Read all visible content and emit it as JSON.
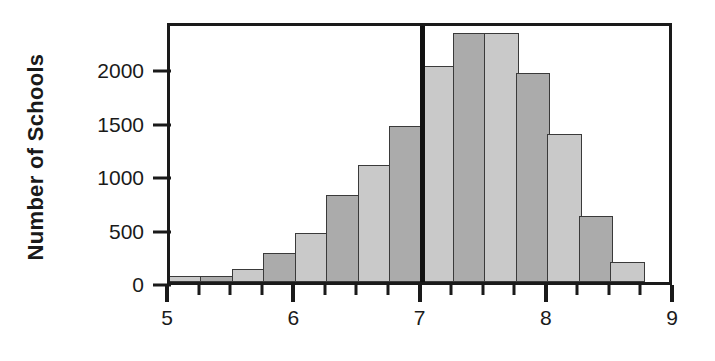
{
  "chart_data": {
    "type": "bar",
    "title": "",
    "subtitle": "",
    "xlabel": "",
    "ylabel": "Number of Schools",
    "xlim": [
      5,
      9
    ],
    "ylim": [
      0,
      2450
    ],
    "grid": false,
    "legend": null,
    "bin_width": 0.25,
    "x_tick_labels": [
      "5",
      "6",
      "7",
      "8",
      "9"
    ],
    "x_tick_values": [
      5,
      6,
      7,
      8,
      9
    ],
    "x_minor_tick_values": [
      5.25,
      5.5,
      5.75,
      6.25,
      6.5,
      6.75,
      7.25,
      7.5,
      7.75,
      8.25,
      8.5,
      8.75
    ],
    "y_tick_labels": [
      "0",
      "500",
      "1000",
      "1500",
      "2000"
    ],
    "y_tick_values": [
      0,
      500,
      1000,
      1500,
      2000
    ],
    "categories": [
      "5.00-5.25",
      "5.25-5.50",
      "5.50-5.75",
      "5.75-6.00",
      "6.00-6.25",
      "6.25-6.50",
      "6.50-6.75",
      "6.75-7.00",
      "7.00-7.25",
      "7.25-7.50",
      "7.50-7.75",
      "7.75-8.00",
      "8.00-8.25",
      "8.25-8.50",
      "8.50-8.75",
      "8.75-9.00"
    ],
    "bin_starts": [
      5.0,
      5.25,
      5.5,
      5.75,
      6.0,
      6.25,
      6.5,
      6.75,
      7.0,
      7.25,
      7.5,
      7.75,
      8.0,
      8.25,
      8.5,
      8.75
    ],
    "values": [
      60,
      60,
      120,
      270,
      455,
      810,
      1095,
      1460,
      2020,
      2330,
      2330,
      1950,
      1380,
      615,
      190,
      0
    ],
    "bar_colors": [
      "#c9c9c9",
      "#ababab",
      "#c9c9c9",
      "#ababab",
      "#c9c9c9",
      "#ababab",
      "#c9c9c9",
      "#ababab",
      "#c9c9c9",
      "#ababab",
      "#c9c9c9",
      "#ababab",
      "#c9c9c9",
      "#ababab",
      "#c9c9c9",
      "#ababab"
    ],
    "annotations": [
      {
        "name": "reference-line",
        "type": "vline",
        "x": 7.0,
        "color": "#111111"
      }
    ]
  },
  "colors": {
    "axis": "#1a1a1a",
    "bar_light": "#c9c9c9",
    "bar_dark": "#ababab",
    "bar_edge": "#3a3a3a",
    "reference_line": "#111111",
    "background": "#ffffff"
  }
}
